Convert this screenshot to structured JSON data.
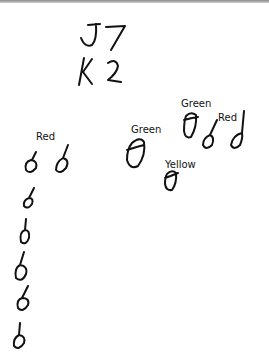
{
  "sketch": {
    "heading_line1": "J7",
    "heading_line2": "K2",
    "labels": [
      {
        "id": "left-red",
        "text": "Red",
        "x": 36,
        "y": 132
      },
      {
        "id": "mid-green",
        "text": "Green",
        "x": 131,
        "y": 125
      },
      {
        "id": "top-green",
        "text": "Green",
        "x": 181,
        "y": 99
      },
      {
        "id": "right-red",
        "text": "Red",
        "x": 218,
        "y": 113
      },
      {
        "id": "yellow",
        "text": "Yellow",
        "x": 165,
        "y": 160
      }
    ],
    "colors": {
      "ink": "#111111",
      "background": "#ffffff",
      "top_border": "#8a8a8a"
    }
  }
}
